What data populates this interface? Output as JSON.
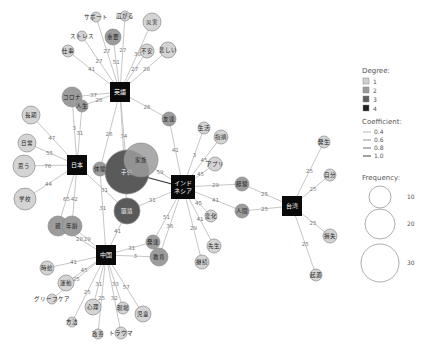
{
  "legend": {
    "degree_title": "Degree:",
    "degree_items": [
      {
        "label": "1",
        "color": "#cfcfcf"
      },
      {
        "label": "2",
        "color": "#9a9a9a"
      },
      {
        "label": "3",
        "color": "#5e5e5e"
      },
      {
        "label": "4",
        "color": "#1e1e1e"
      }
    ],
    "coefficient_title": "Coefficient:",
    "coefficient_items": [
      {
        "label": "0.4",
        "width": 0.6
      },
      {
        "label": "0.6",
        "width": 0.9
      },
      {
        "label": "0.8",
        "width": 1.2
      },
      {
        "label": "1.0",
        "width": 1.6
      }
    ],
    "frequency_title": "Frequency:",
    "frequency_items": [
      {
        "label": "10",
        "r": 11
      },
      {
        "label": "20",
        "r": 15
      },
      {
        "label": "30",
        "r": 19
      }
    ]
  },
  "hubs": [
    {
      "id": "eigo",
      "label": "英語",
      "x": 120,
      "y": 92
    },
    {
      "id": "nihon",
      "label": "日本",
      "x": 77,
      "y": 165
    },
    {
      "id": "indonesia",
      "label": "インド\nネシア",
      "x": 183,
      "y": 187
    },
    {
      "id": "taiwan",
      "label": "台湾",
      "x": 292,
      "y": 206
    },
    {
      "id": "chugoku",
      "label": "中国",
      "x": 106,
      "y": 255
    }
  ],
  "nodes": [
    {
      "id": "n_support",
      "label": "サポート",
      "x": 96,
      "y": 17,
      "r": 5,
      "deg": 1,
      "ext": true
    },
    {
      "id": "n_hirogaru",
      "label": "広がる",
      "x": 125,
      "y": 16,
      "r": 5,
      "deg": 1,
      "ext": true
    },
    {
      "id": "n_saigai",
      "label": "災害",
      "x": 152,
      "y": 22,
      "r": 9,
      "deg": 1
    },
    {
      "id": "n_stress",
      "label": "ストレス",
      "x": 82,
      "y": 36,
      "r": 5,
      "deg": 1,
      "ext": true
    },
    {
      "id": "n_juuyou",
      "label": "重要",
      "x": 113,
      "y": 37,
      "r": 8,
      "deg": 2
    },
    {
      "id": "n_shigoto",
      "label": "仕事",
      "x": 68,
      "y": 51,
      "r": 6,
      "deg": 1
    },
    {
      "id": "n_fuan",
      "label": "不安",
      "x": 147,
      "y": 51,
      "r": 7,
      "deg": 1
    },
    {
      "id": "n_kanashii",
      "label": "悲しい",
      "x": 168,
      "y": 50,
      "r": 8,
      "deg": 1
    },
    {
      "id": "n_coffee",
      "label": "コロナ",
      "x": 72,
      "y": 97,
      "r": 10,
      "deg": 2
    },
    {
      "id": "n_jinsei",
      "label": "人生",
      "x": 82,
      "y": 106,
      "r": 6,
      "deg": 2
    },
    {
      "id": "n_tomodachi",
      "label": "友達",
      "x": 169,
      "y": 119,
      "r": 7,
      "deg": 2
    },
    {
      "id": "n_choki",
      "label": "長期",
      "x": 31,
      "y": 115,
      "r": 9,
      "deg": 1
    },
    {
      "id": "n_nichijou",
      "label": "日常",
      "x": 27,
      "y": 143,
      "r": 9,
      "deg": 1
    },
    {
      "id": "n_omou",
      "label": "思う",
      "x": 24,
      "y": 166,
      "r": 11,
      "deg": 1
    },
    {
      "id": "n_gakkou",
      "label": "学校",
      "x": 25,
      "y": 199,
      "r": 11,
      "deg": 1
    },
    {
      "id": "n_taiken",
      "label": "体験",
      "x": 100,
      "y": 169,
      "r": 7,
      "deg": 2
    },
    {
      "id": "n_kodomo",
      "label": "子供",
      "x": 127,
      "y": 172,
      "r": 22,
      "deg": 3
    },
    {
      "id": "n_kazoku",
      "label": "家族",
      "x": 141,
      "y": 160,
      "r": 17,
      "deg": 2
    },
    {
      "id": "n_kankyou",
      "label": "環境",
      "x": 127,
      "y": 211,
      "r": 13,
      "deg": 3
    },
    {
      "id": "n_oya",
      "label": "親",
      "x": 58,
      "y": 226,
      "r": 10,
      "deg": 2
    },
    {
      "id": "n_nenrei",
      "label": "年齢",
      "x": 72,
      "y": 226,
      "r": 10,
      "deg": 2
    },
    {
      "id": "n_seikatsu",
      "label": "生活",
      "x": 204,
      "y": 128,
      "r": 6,
      "deg": 1
    },
    {
      "id": "n_shiteki",
      "label": "指摘",
      "x": 221,
      "y": 137,
      "r": 7,
      "deg": 1
    },
    {
      "id": "n_apuri",
      "label": "アプリ",
      "x": 215,
      "y": 164,
      "r": 7,
      "deg": 1,
      "ext": true
    },
    {
      "id": "n_keiken",
      "label": "経験",
      "x": 242,
      "y": 184,
      "r": 7,
      "deg": 2
    },
    {
      "id": "n_ningen",
      "label": "人間",
      "x": 242,
      "y": 211,
      "r": 7,
      "deg": 2
    },
    {
      "id": "n_henka",
      "label": "変化",
      "x": 211,
      "y": 216,
      "r": 6,
      "deg": 1
    },
    {
      "id": "n_sensei",
      "label": "先生",
      "x": 214,
      "y": 246,
      "r": 7,
      "deg": 1
    },
    {
      "id": "n_hattatsu",
      "label": "発達",
      "x": 153,
      "y": 242,
      "r": 7,
      "deg": 2
    },
    {
      "id": "n_kyouiku",
      "label": "教育",
      "x": 159,
      "y": 257,
      "r": 9,
      "deg": 2
    },
    {
      "id": "n_keizoku",
      "label": "継続",
      "x": 202,
      "y": 262,
      "r": 7,
      "deg": 1
    },
    {
      "id": "n_hassei",
      "label": "発生",
      "x": 324,
      "y": 142,
      "r": 6,
      "deg": 1
    },
    {
      "id": "n_jibun",
      "label": "自分",
      "x": 330,
      "y": 175,
      "r": 6,
      "deg": 1
    },
    {
      "id": "n_bonus",
      "label": "損失",
      "x": 330,
      "y": 236,
      "r": 7,
      "deg": 1
    },
    {
      "id": "n_kigen",
      "label": "起源",
      "x": 316,
      "y": 275,
      "r": 6,
      "deg": 1
    },
    {
      "id": "n_jikan",
      "label": "時給",
      "x": 47,
      "y": 268,
      "r": 7,
      "deg": 1
    },
    {
      "id": "n_katsudou",
      "label": "運動",
      "x": 66,
      "y": 283,
      "r": 8,
      "deg": 1
    },
    {
      "id": "n_grief",
      "label": "グリーフケア",
      "x": 52,
      "y": 299,
      "r": 5,
      "deg": 1,
      "ext": true
    },
    {
      "id": "n_houhou",
      "label": "方法",
      "x": 72,
      "y": 322,
      "r": 5,
      "deg": 1,
      "ext": true
    },
    {
      "id": "n_shinri",
      "label": "心理",
      "x": 93,
      "y": 307,
      "r": 8,
      "deg": 1
    },
    {
      "id": "n_kaizen",
      "label": "改善",
      "x": 98,
      "y": 334,
      "r": 5,
      "deg": 1,
      "ext": true
    },
    {
      "id": "n_trauma",
      "label": "トラウマ",
      "x": 121,
      "y": 333,
      "r": 6,
      "deg": 1,
      "ext": true
    },
    {
      "id": "n_genba",
      "label": "現場",
      "x": 123,
      "y": 308,
      "r": 6,
      "deg": 1
    },
    {
      "id": "n_jidou",
      "label": "児童",
      "x": 143,
      "y": 314,
      "r": 8,
      "deg": 1
    }
  ],
  "edges": [
    {
      "from": "eigo",
      "to": "n_support",
      "label": "27"
    },
    {
      "from": "eigo",
      "to": "n_hirogaru",
      "label": "27"
    },
    {
      "from": "eigo",
      "to": "n_saigai",
      "label": "30"
    },
    {
      "from": "eigo",
      "to": "n_stress",
      "label": "27"
    },
    {
      "from": "eigo",
      "to": "n_juuyou",
      "label": "51"
    },
    {
      "from": "eigo",
      "to": "n_shigoto",
      "label": "41"
    },
    {
      "from": "eigo",
      "to": "n_fuan",
      "label": "27"
    },
    {
      "from": "eigo",
      "to": "n_kanashii",
      "label": "28"
    },
    {
      "from": "eigo",
      "to": "n_coffee",
      "label": "37"
    },
    {
      "from": "eigo",
      "to": "n_jinsei",
      "label": "26"
    },
    {
      "from": "eigo",
      "to": "n_tomodachi",
      "label": "26"
    },
    {
      "from": "eigo",
      "to": "n_taiken",
      "label": "26"
    },
    {
      "from": "eigo",
      "to": "n_kodomo",
      "label": "34"
    },
    {
      "from": "nihon",
      "to": "n_coffee",
      "label": "3"
    },
    {
      "from": "nihon",
      "to": "n_jinsei",
      "label": "31"
    },
    {
      "from": "nihon",
      "to": "n_choki",
      "label": "47"
    },
    {
      "from": "nihon",
      "to": "n_nichijou",
      "label": "55"
    },
    {
      "from": "nihon",
      "to": "n_omou",
      "label": "76"
    },
    {
      "from": "nihon",
      "to": "n_gakkou",
      "label": "44"
    },
    {
      "from": "nihon",
      "to": "n_oya",
      "label": "65"
    },
    {
      "from": "nihon",
      "to": "n_nenrei",
      "label": "42"
    },
    {
      "from": "nihon",
      "to": "n_kankyou",
      "label": "31"
    },
    {
      "from": "indonesia",
      "to": "n_tomodachi",
      "label": "41"
    },
    {
      "from": "indonesia",
      "to": "n_kodomo",
      "label": "",
      "strong": true
    },
    {
      "from": "indonesia",
      "to": "n_kazoku",
      "label": "59"
    },
    {
      "from": "indonesia",
      "to": "n_seikatsu",
      "label": "3"
    },
    {
      "from": "indonesia",
      "to": "n_shiteki",
      "label": "45"
    },
    {
      "from": "indonesia",
      "to": "n_apuri",
      "label": "45"
    },
    {
      "from": "indonesia",
      "to": "n_keiken",
      "label": "29"
    },
    {
      "from": "indonesia",
      "to": "n_ningen",
      "label": "41"
    },
    {
      "from": "indonesia",
      "to": "n_henka",
      "label": "45"
    },
    {
      "from": "indonesia",
      "to": "n_sensei",
      "label": "41"
    },
    {
      "from": "indonesia",
      "to": "n_keizoku",
      "label": "29"
    },
    {
      "from": "indonesia",
      "to": "n_hattatsu",
      "label": "51"
    },
    {
      "from": "indonesia",
      "to": "n_kyouiku",
      "label": "36"
    },
    {
      "from": "indonesia",
      "to": "n_kankyou",
      "label": "31"
    },
    {
      "from": "taiwan",
      "to": "n_keiken",
      "label": "25"
    },
    {
      "from": "taiwan",
      "to": "n_ningen",
      "label": "25"
    },
    {
      "from": "taiwan",
      "to": "n_hassei",
      "label": "25"
    },
    {
      "from": "taiwan",
      "to": "n_jibun",
      "label": "25"
    },
    {
      "from": "taiwan",
      "to": "n_bonus",
      "label": "25"
    },
    {
      "from": "taiwan",
      "to": "n_kigen",
      "label": "25"
    },
    {
      "from": "chugoku",
      "to": "n_taiken",
      "label": "31"
    },
    {
      "from": "chugoku",
      "to": "n_kankyou",
      "label": "41"
    },
    {
      "from": "chugoku",
      "to": "n_oya",
      "label": "28"
    },
    {
      "from": "chugoku",
      "to": "n_nenrei",
      "label": "29"
    },
    {
      "from": "chugoku",
      "to": "n_hattatsu",
      "label": "31"
    },
    {
      "from": "chugoku",
      "to": "n_kyouiku",
      "label": "3"
    },
    {
      "from": "chugoku",
      "to": "n_jikan",
      "label": "41"
    },
    {
      "from": "chugoku",
      "to": "n_katsudou",
      "label": "45"
    },
    {
      "from": "chugoku",
      "to": "n_grief",
      "label": "25"
    },
    {
      "from": "chugoku",
      "to": "n_houhou",
      "label": "25"
    },
    {
      "from": "chugoku",
      "to": "n_shinri",
      "label": "31"
    },
    {
      "from": "chugoku",
      "to": "n_kaizen",
      "label": "25"
    },
    {
      "from": "chugoku",
      "to": "n_trauma",
      "label": "32"
    },
    {
      "from": "chugoku",
      "to": "n_genba",
      "label": "33"
    },
    {
      "from": "chugoku",
      "to": "n_jidou",
      "label": "57"
    },
    {
      "from": "eigo",
      "to": "n_kankyou",
      "label": "26"
    }
  ]
}
